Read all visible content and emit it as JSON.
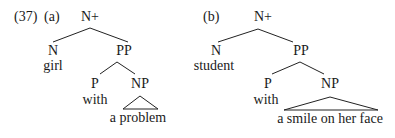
{
  "example_number": "(37)",
  "trees": [
    {
      "label": "(a)",
      "root": "N+",
      "head": {
        "category": "N",
        "word": "girl"
      },
      "complement": {
        "category": "PP",
        "head": {
          "category": "P",
          "word": "with"
        },
        "object": {
          "category": "NP",
          "word": "a problem",
          "triangle": true
        }
      }
    },
    {
      "label": "(b)",
      "root": "N+",
      "head": {
        "category": "N",
        "word": "student"
      },
      "complement": {
        "category": "PP",
        "head": {
          "category": "P",
          "word": "with"
        },
        "object": {
          "category": "NP",
          "word": "a smile on her face",
          "triangle": true
        }
      }
    }
  ]
}
